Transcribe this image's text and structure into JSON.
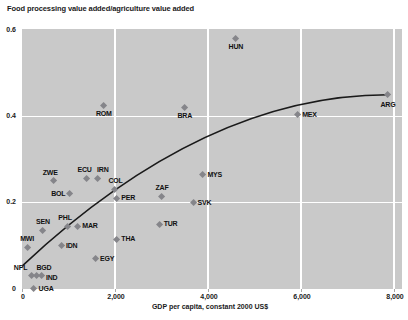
{
  "chart_data": {
    "type": "scatter",
    "title": "Food processing value added/agriculture value added",
    "xlabel": "GDP per capita, constant 2000 US$",
    "ylabel": "Food processing value added/agriculture value added",
    "xlim": [
      0,
      8170
    ],
    "ylim": [
      0,
      0.6
    ],
    "grid": true,
    "x_ticks": [
      0,
      2000,
      4000,
      6000,
      8000
    ],
    "x_tick_labels": [
      "0",
      "2,000",
      "4,000",
      "6,000",
      "8,000"
    ],
    "y_ticks": [
      0,
      0.2,
      0.4,
      0.6
    ],
    "y_tick_labels": [
      "0",
      "0.2",
      "0.4",
      "0.6"
    ],
    "points": [
      {
        "code": "HUN",
        "gdp": 4600,
        "ratio": 0.58,
        "label_pos": "below"
      },
      {
        "code": "ARG",
        "gdp": 7870,
        "ratio": 0.45,
        "label_pos": "below",
        "dy": 2
      },
      {
        "code": "MEX",
        "gdp": 5930,
        "ratio": 0.403,
        "label_pos": "right"
      },
      {
        "code": "ROM",
        "gdp": 1760,
        "ratio": 0.425,
        "label_pos": "below"
      },
      {
        "code": "BRA",
        "gdp": 3500,
        "ratio": 0.42,
        "label_pos": "below"
      },
      {
        "code": "MYS",
        "gdp": 3890,
        "ratio": 0.265,
        "label_pos": "right"
      },
      {
        "code": "ECU",
        "gdp": 1390,
        "ratio": 0.255,
        "label_pos": "above",
        "dx": -2
      },
      {
        "code": "IRN",
        "gdp": 1630,
        "ratio": 0.255,
        "label_pos": "above",
        "dx": 5
      },
      {
        "code": "ZWE",
        "gdp": 670,
        "ratio": 0.25,
        "label_pos": "above",
        "dx": -3
      },
      {
        "code": "COL",
        "gdp": 1990,
        "ratio": 0.23,
        "label_pos": "above",
        "dx": 1
      },
      {
        "code": "BOL",
        "gdp": 1030,
        "ratio": 0.22,
        "label_pos": "left"
      },
      {
        "code": "ZAF",
        "gdp": 3010,
        "ratio": 0.215,
        "label_pos": "above"
      },
      {
        "code": "PER",
        "gdp": 2040,
        "ratio": 0.21,
        "label_pos": "right"
      },
      {
        "code": "SVK",
        "gdp": 3680,
        "ratio": 0.2,
        "label_pos": "right"
      },
      {
        "code": "TUR",
        "gdp": 2950,
        "ratio": 0.15,
        "label_pos": "right"
      },
      {
        "code": "PHL",
        "gdp": 990,
        "ratio": 0.145,
        "label_pos": "above",
        "dx": -3
      },
      {
        "code": "MAR",
        "gdp": 1200,
        "ratio": 0.145,
        "label_pos": "right"
      },
      {
        "code": "SEN",
        "gdp": 450,
        "ratio": 0.135,
        "label_pos": "above"
      },
      {
        "code": "THA",
        "gdp": 2040,
        "ratio": 0.115,
        "label_pos": "right"
      },
      {
        "code": "IDN",
        "gdp": 850,
        "ratio": 0.1,
        "label_pos": "right"
      },
      {
        "code": "MWI",
        "gdp": 110,
        "ratio": 0.095,
        "label_pos": "above"
      },
      {
        "code": "EGY",
        "gdp": 1580,
        "ratio": 0.07,
        "label_pos": "right"
      },
      {
        "code": "NPL",
        "gdp": 210,
        "ratio": 0.03,
        "label_pos": "left",
        "dy": -8
      },
      {
        "code": "BGD",
        "gdp": 320,
        "ratio": 0.03,
        "label_pos": "above",
        "dx": 7
      },
      {
        "code": "IND",
        "gdp": 420,
        "ratio": 0.03,
        "label_pos": "right",
        "dy": 2
      },
      {
        "code": "UGA",
        "gdp": 260,
        "ratio": 0.0,
        "label_pos": "right"
      }
    ],
    "trend": {
      "shape": "quadratic-fit",
      "start": {
        "gdp": 20,
        "ratio": 0.055
      },
      "control": {
        "gdp": 3940,
        "ratio": 0.45
      },
      "end": {
        "gdp": 7870,
        "ratio": 0.45
      }
    },
    "legend": null
  },
  "colors": {
    "plot_bg": "#c9c9c9",
    "gridline": "#ffffff",
    "marker": "#85858a",
    "trend_line": "#1a1a1a",
    "text": "#1a1a1a"
  }
}
